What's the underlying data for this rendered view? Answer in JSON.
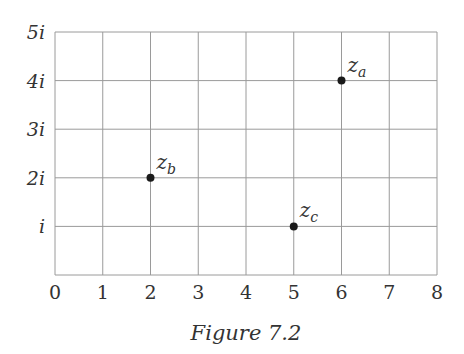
{
  "figure": {
    "caption": "Figure 7.2",
    "x_ticks": [
      "0",
      "1",
      "2",
      "3",
      "4",
      "5",
      "6",
      "7",
      "8"
    ],
    "y_ticks": [
      "i",
      "2i",
      "3i",
      "4i",
      "5i"
    ],
    "points": [
      {
        "name": "z",
        "sub": "a",
        "re": 6,
        "im": 4
      },
      {
        "name": "z",
        "sub": "b",
        "re": 2,
        "im": 2
      },
      {
        "name": "z",
        "sub": "c",
        "re": 5,
        "im": 1
      }
    ],
    "colors": {
      "grid": "#9a9a9a",
      "point": "#1a1a1a",
      "text": "#333333"
    }
  },
  "chart_data": {
    "type": "scatter",
    "title": "Figure 7.2",
    "xlabel": "Real part",
    "ylabel": "Imaginary part",
    "xlim": [
      0,
      8
    ],
    "ylim": [
      0,
      5
    ],
    "x_tick_labels": [
      "0",
      "1",
      "2",
      "3",
      "4",
      "5",
      "6",
      "7",
      "8"
    ],
    "y_tick_labels": [
      "i",
      "2i",
      "3i",
      "4i",
      "5i"
    ],
    "grid": true,
    "series": [
      {
        "name": "points",
        "labels": [
          "z_a",
          "z_b",
          "z_c"
        ],
        "x": [
          6,
          2,
          5
        ],
        "y": [
          4,
          2,
          1
        ]
      }
    ]
  }
}
